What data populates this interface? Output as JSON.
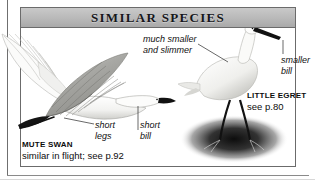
{
  "panel": {
    "header": {
      "title": "SIMILAR SPECIES"
    },
    "border_color": "#6b6b6b",
    "header_gradient_top": "#c9c9c9",
    "header_gradient_bottom": "#a9a9a9"
  },
  "annotations": [
    {
      "id": "much-smaller",
      "text": "much smaller\nand slimmer",
      "style": "italic"
    },
    {
      "id": "smaller-bill",
      "text": "smaller\nbill",
      "style": "italic"
    },
    {
      "id": "short-legs",
      "text": "short\nlegs",
      "style": "italic"
    },
    {
      "id": "short-bill",
      "text": "short\nbill",
      "style": "italic"
    }
  ],
  "species": [
    {
      "id": "little-egret",
      "name": "LITTLE EGRET",
      "reference": "see p.80",
      "pose": "standing-in-water"
    },
    {
      "id": "mute-swan",
      "name": "MUTE SWAN",
      "reference": "similar in flight; see p.92",
      "pose": "flying"
    }
  ],
  "artwork": {
    "swan_label": "flying-mute-swan-illustration",
    "egret_label": "standing-little-egret-illustration",
    "shadow_label": "water-shadow-ellipse",
    "ink_color": "#1a1a1a",
    "plumage_light": "#f4f4f2",
    "plumage_shade": "#9a9a96"
  }
}
